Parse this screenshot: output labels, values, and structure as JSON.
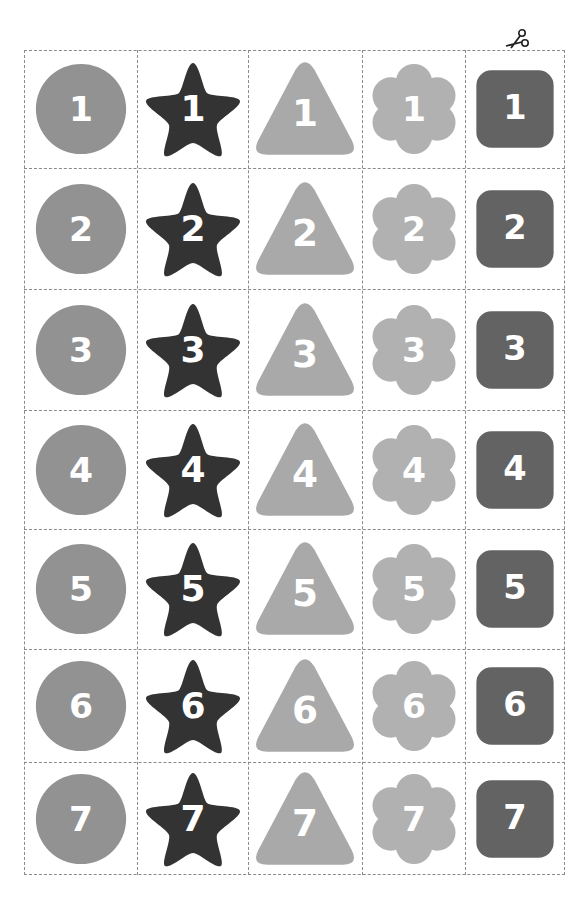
{
  "sheet": {
    "shapes": [
      {
        "name": "circle",
        "color": "#929292"
      },
      {
        "name": "star",
        "color": "#333333"
      },
      {
        "name": "triangle",
        "color": "#a9a9a9"
      },
      {
        "name": "flower",
        "color": "#b1b1b1"
      },
      {
        "name": "rounded-square",
        "color": "#636363"
      }
    ],
    "rows": [
      {
        "number": "1"
      },
      {
        "number": "2"
      },
      {
        "number": "3"
      },
      {
        "number": "4"
      },
      {
        "number": "5"
      },
      {
        "number": "6"
      },
      {
        "number": "7"
      }
    ],
    "cut_line_icon": "scissors-icon",
    "column_edges": [
      24,
      137,
      248,
      362,
      465,
      565
    ],
    "row_edges": [
      50,
      168,
      289,
      410,
      529,
      649,
      762,
      875
    ]
  }
}
